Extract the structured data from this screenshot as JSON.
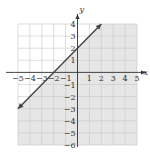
{
  "chart_data": {
    "type": "line",
    "title": "",
    "xlabel": "x",
    "ylabel": "y",
    "xlim": [
      -5,
      5
    ],
    "ylim": [
      -6,
      4
    ],
    "grid": true,
    "x_ticks": [
      "-5",
      "-4",
      "-3",
      "-2",
      "-1",
      "1",
      "2",
      "3",
      "4",
      "5"
    ],
    "y_ticks": [
      "4",
      "3",
      "2",
      "1",
      "-1",
      "-2",
      "-3",
      "-4",
      "-5",
      "-6"
    ],
    "series": [
      {
        "name": "y = x + 2",
        "style": "solid",
        "arrows": "both",
        "x": [
          -5,
          2
        ],
        "y": [
          -3,
          4
        ]
      }
    ],
    "shaded_region": "below line (y <= x + 2)",
    "colors": {
      "shade": "#e6e6e6",
      "grid": "#c8c8c8",
      "line": "#444444",
      "axis": "#333333"
    }
  }
}
